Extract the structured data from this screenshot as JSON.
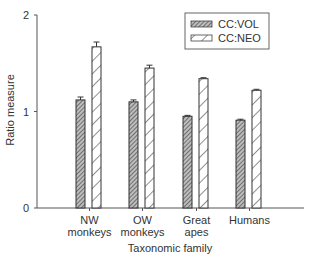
{
  "chart_data": {
    "type": "bar",
    "title": "",
    "xlabel": "Taxonomic family",
    "ylabel": "Ratio measure",
    "ylim": [
      0,
      2
    ],
    "yticks": [
      0,
      1,
      2
    ],
    "grid": false,
    "legend_position": "top-right",
    "categories": [
      "NW monkeys",
      "OW monkeys",
      "Great apes",
      "Humans"
    ],
    "category_lines": [
      [
        "NW",
        "monkeys"
      ],
      [
        "OW",
        "monkeys"
      ],
      [
        "Great",
        "apes"
      ],
      [
        "Humans"
      ]
    ],
    "series": [
      {
        "name": "CC:VOL",
        "pattern": "dense-hatch",
        "values": [
          1.12,
          1.1,
          0.95,
          0.91
        ],
        "errors": [
          0.03,
          0.02,
          0.01,
          0.01
        ]
      },
      {
        "name": "CC:NEO",
        "pattern": "sparse-hatch",
        "values": [
          1.67,
          1.45,
          1.34,
          1.22
        ],
        "errors": [
          0.05,
          0.03,
          0.01,
          0.01
        ]
      }
    ]
  }
}
